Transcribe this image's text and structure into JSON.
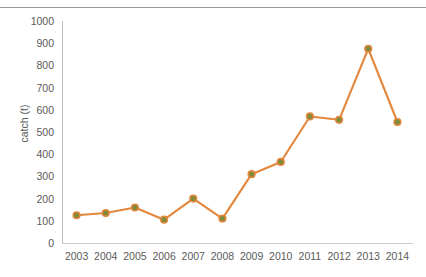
{
  "chart_data": {
    "type": "line",
    "title": "",
    "subtitle": "",
    "xlabel": "",
    "ylabel": "catch (t)",
    "categories": [
      "2003",
      "2004",
      "2005",
      "2006",
      "2007",
      "2008",
      "2009",
      "2010",
      "2011",
      "2012",
      "2013",
      "2014"
    ],
    "series": [
      {
        "name": "catch",
        "values": [
          125,
          135,
          160,
          105,
          200,
          110,
          310,
          365,
          570,
          555,
          875,
          545
        ]
      }
    ],
    "x": [
      2003,
      2004,
      2005,
      2006,
      2007,
      2008,
      2009,
      2010,
      2011,
      2012,
      2013,
      2014
    ],
    "ylim": [
      0,
      1000
    ],
    "ytick_labels": [
      "1000",
      "900",
      "800",
      "700",
      "600",
      "500",
      "400",
      "300",
      "200",
      "100",
      "0"
    ],
    "ytick_values": [
      1000,
      900,
      800,
      700,
      600,
      500,
      400,
      300,
      200,
      100,
      0
    ],
    "ytick_step": 100,
    "grid": false,
    "legend": false,
    "legend_position": "none",
    "line_color": "#E2873C",
    "marker_fill_color": "#7D8B3A",
    "marker_edge_color": "#E2873C",
    "axis_color": "#B6BCC4",
    "text_color": "#5A5A5A",
    "background_color": "#FFFFFF"
  }
}
